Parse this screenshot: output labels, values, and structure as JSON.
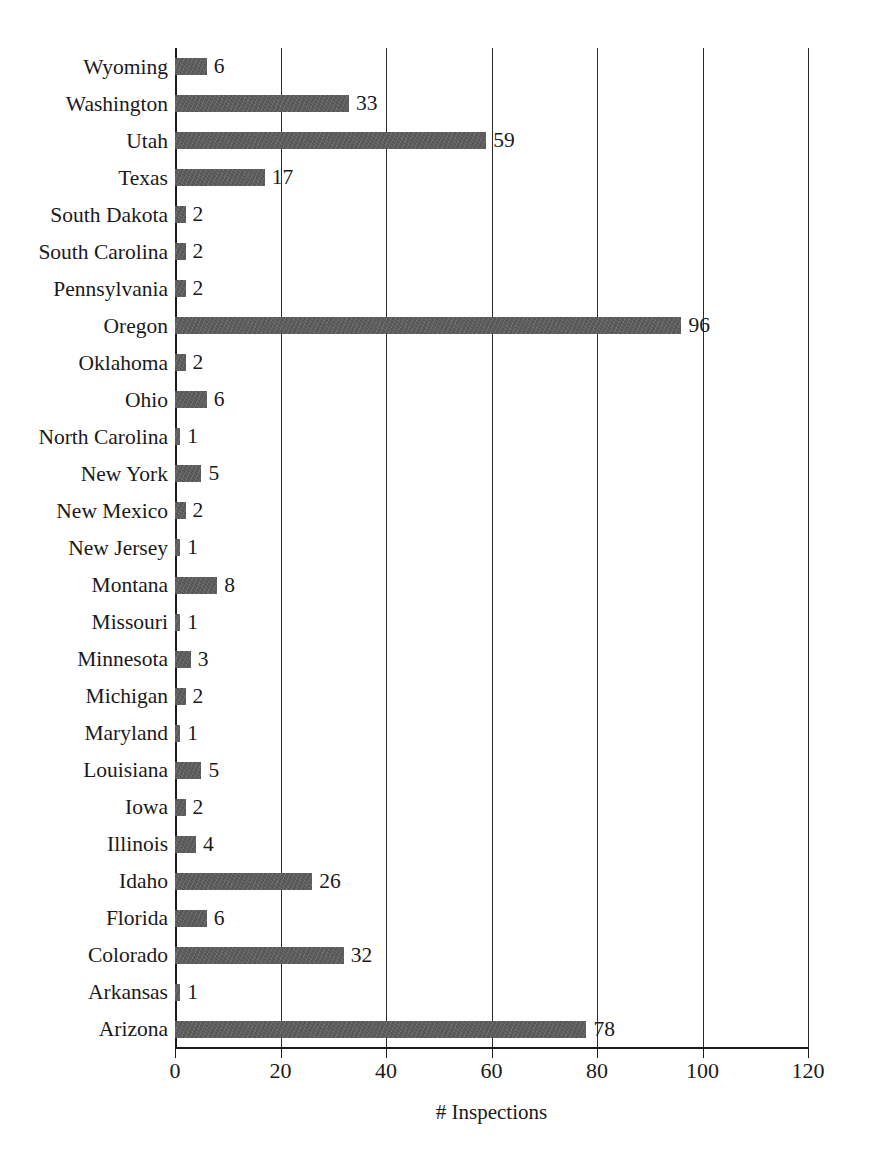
{
  "chart_data": {
    "type": "bar",
    "orientation": "horizontal",
    "title": "",
    "xlabel": "# Inspections",
    "ylabel": "",
    "xlim": [
      0,
      120
    ],
    "xticks": [
      0,
      20,
      40,
      60,
      80,
      100,
      120
    ],
    "grid": "vertical",
    "legend": "none",
    "show_value_labels": true,
    "bar_color": "#575757",
    "axis_color": "#1a1a1a",
    "categories": [
      "Wyoming",
      "Washington",
      "Utah",
      "Texas",
      "South Dakota",
      "South Carolina",
      "Pennsylvania",
      "Oregon",
      "Oklahoma",
      "Ohio",
      "North Carolina",
      "New York",
      "New Mexico",
      "New Jersey",
      "Montana",
      "Missouri",
      "Minnesota",
      "Michigan",
      "Maryland",
      "Louisiana",
      "Iowa",
      "Illinois",
      "Idaho",
      "Florida",
      "Colorado",
      "Arkansas",
      "Arizona"
    ],
    "values": [
      6,
      33,
      59,
      17,
      2,
      2,
      2,
      96,
      2,
      6,
      1,
      5,
      2,
      1,
      8,
      1,
      3,
      2,
      1,
      5,
      2,
      4,
      26,
      6,
      32,
      1,
      78
    ],
    "value_labels": [
      "6",
      "33",
      "59",
      "17",
      "2",
      "2",
      "2",
      "96",
      "2",
      "6",
      "1",
      "5",
      "2",
      "1",
      "8",
      "1",
      "3",
      "2",
      "1",
      "5",
      "2",
      "4",
      "26",
      "6",
      "32",
      "1",
      "78"
    ]
  }
}
